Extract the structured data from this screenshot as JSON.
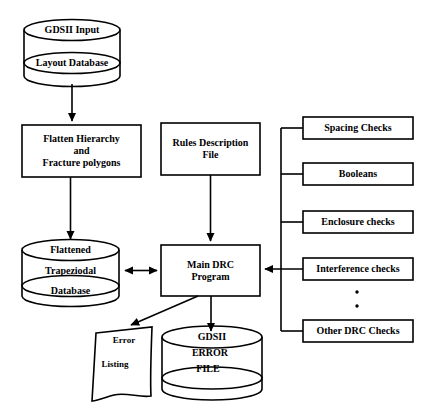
{
  "diagram": {
    "type": "flowchart",
    "stroke_color": "#000000",
    "fill_color": "#ffffff",
    "nodes": {
      "input_db": {
        "shape": "cylinder",
        "line1": "GDSII Input",
        "line2": "Layout Database"
      },
      "flatten": {
        "shape": "rectangle",
        "line1": "Flatten Hierarchy",
        "line2": "and",
        "line3": "Fracture polygons"
      },
      "rules_file": {
        "shape": "rectangle",
        "line1": "Rules Description",
        "line2": "File"
      },
      "flat_db": {
        "shape": "cylinder",
        "line1": "Flattened",
        "line2": "Trapeziodal",
        "line3": "Database"
      },
      "main_drc": {
        "shape": "rectangle",
        "line1": "Main DRC",
        "line2": "Program"
      },
      "error_listing": {
        "shape": "document",
        "line1": "Error",
        "line2": "Listing"
      },
      "error_file": {
        "shape": "cylinder",
        "line1": "GDSII",
        "line2": "ERROR",
        "line3": "FILE"
      }
    },
    "checks": [
      {
        "label": "Spacing Checks"
      },
      {
        "label": "Booleans"
      },
      {
        "label": "Enclosure checks"
      },
      {
        "label": "Interference checks"
      },
      {
        "label": "Other DRC Checks"
      }
    ],
    "ellipsis": "·",
    "edges": [
      {
        "name": "input-db-to-flatten",
        "from": "input_db",
        "to": "flatten",
        "arrow": "single"
      },
      {
        "name": "flatten-to-flat-db",
        "from": "flatten",
        "to": "flat_db",
        "arrow": "single"
      },
      {
        "name": "flat-db-to-main-drc",
        "from": "flat_db",
        "to": "main_drc",
        "arrow": "double"
      },
      {
        "name": "rules-file-to-main-drc",
        "from": "rules_file",
        "to": "main_drc",
        "arrow": "single"
      },
      {
        "name": "checks-bus-to-main-drc",
        "from": "checks",
        "to": "main_drc",
        "arrow": "single"
      },
      {
        "name": "main-drc-to-error-listing",
        "from": "main_drc",
        "to": "error_listing",
        "arrow": "single"
      },
      {
        "name": "main-drc-to-error-file",
        "from": "main_drc",
        "to": "error_file",
        "arrow": "single"
      }
    ]
  }
}
